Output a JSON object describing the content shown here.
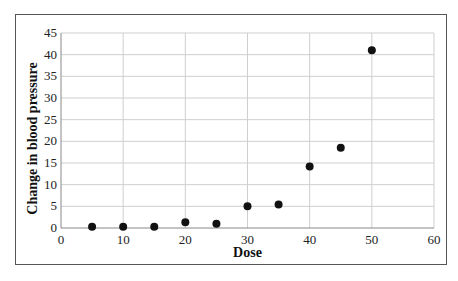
{
  "chart_data": {
    "type": "scatter",
    "title": "",
    "xlabel": "Dose",
    "ylabel": "Change in blood pressure",
    "xlim": [
      0,
      60
    ],
    "ylim": [
      0,
      45
    ],
    "xticks": [
      0,
      10,
      20,
      30,
      40,
      50,
      60
    ],
    "yticks": [
      0,
      5,
      10,
      15,
      20,
      25,
      30,
      35,
      40,
      45
    ],
    "grid": true,
    "legend": "none",
    "series": [
      {
        "name": "Change in blood pressure",
        "color": "#111111",
        "points": [
          {
            "x": 5,
            "y": 0.3
          },
          {
            "x": 10,
            "y": 0.3
          },
          {
            "x": 15,
            "y": 0.3
          },
          {
            "x": 20,
            "y": 1.3
          },
          {
            "x": 25,
            "y": 1.0
          },
          {
            "x": 30,
            "y": 5.0
          },
          {
            "x": 35,
            "y": 5.4
          },
          {
            "x": 40,
            "y": 14.2
          },
          {
            "x": 45,
            "y": 18.5
          },
          {
            "x": 50,
            "y": 41.0
          }
        ]
      }
    ],
    "grid_color": "#cfcfcf"
  }
}
